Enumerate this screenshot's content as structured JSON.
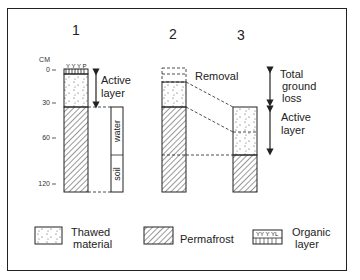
{
  "diagram": {
    "columns": [
      {
        "id": "1",
        "label": "1"
      },
      {
        "id": "2",
        "label": "2"
      },
      {
        "id": "3",
        "label": "3"
      }
    ],
    "depth_axis": {
      "unit": "CM",
      "ticks": [
        "0",
        "30",
        "60",
        "120"
      ]
    },
    "column1": {
      "active_layer_label_1": "Active",
      "active_layer_label_2": "layer",
      "side_bar": {
        "top_label": "water",
        "bottom_label": "soil"
      }
    },
    "column2": {
      "removal_label": "Removal"
    },
    "column3": {
      "total_loss_label_1": "Total",
      "total_loss_label_2": "ground",
      "total_loss_label_3": "loss",
      "active_layer_label_1": "Active",
      "active_layer_label_2": "layer"
    },
    "legend": [
      {
        "key": "thawed",
        "line1": "Thawed",
        "line2": "material"
      },
      {
        "key": "permafrost",
        "line1": "Permafrost",
        "line2": ""
      },
      {
        "key": "organic",
        "line1": "Organic",
        "line2": "layer"
      }
    ],
    "colors": {
      "ink": "#222222",
      "background": "#ffffff"
    }
  }
}
